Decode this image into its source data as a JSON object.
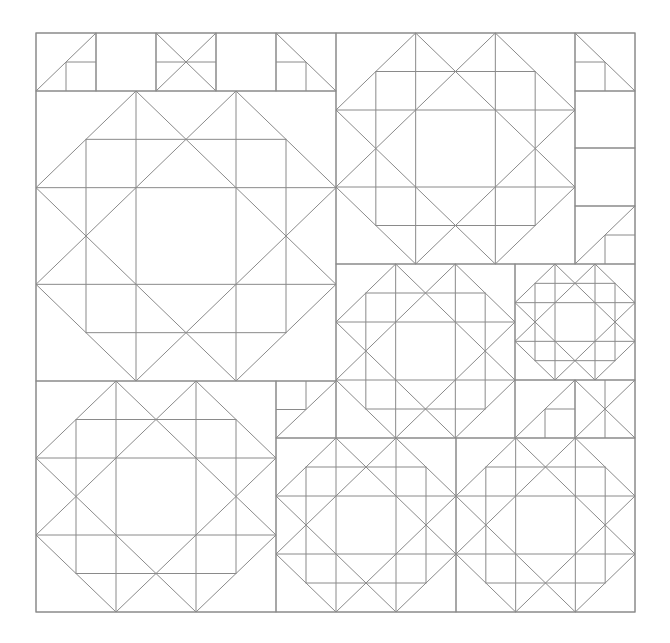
{
  "diagram": {
    "stroke_color": "#8a8a8a",
    "background": "#ffffff",
    "outer_frame": {
      "x": 36,
      "y": 33,
      "w": 599,
      "h": 579
    },
    "star_blocks": [
      {
        "name": "block-large-left",
        "x": 36,
        "y": 91,
        "w": 300,
        "h": 290
      },
      {
        "name": "block-top-middle",
        "x": 336,
        "y": 33,
        "w": 239,
        "h": 231
      },
      {
        "name": "block-center",
        "x": 336,
        "y": 264,
        "w": 179,
        "h": 174
      },
      {
        "name": "block-small-right",
        "x": 515,
        "y": 264,
        "w": 120,
        "h": 116
      },
      {
        "name": "block-bottom-left",
        "x": 36,
        "y": 381,
        "w": 240,
        "h": 231
      },
      {
        "name": "block-bottom-middle",
        "x": 276,
        "y": 438,
        "w": 180,
        "h": 174
      },
      {
        "name": "block-bottom-right",
        "x": 456,
        "y": 438,
        "w": 179,
        "h": 174
      }
    ],
    "filler_cells": [
      {
        "name": "cell-top-1",
        "type": "diag-bl-tr-square-br",
        "x": 36,
        "y": 33,
        "w": 60,
        "h": 58
      },
      {
        "name": "cell-top-2",
        "type": "empty",
        "x": 96,
        "y": 33,
        "w": 60,
        "h": 58
      },
      {
        "name": "cell-top-3",
        "type": "x-cross-midline",
        "x": 156,
        "y": 33,
        "w": 60,
        "h": 58
      },
      {
        "name": "cell-top-4",
        "type": "empty",
        "x": 216,
        "y": 33,
        "w": 60,
        "h": 58
      },
      {
        "name": "cell-top-5",
        "type": "diag-tl-br-square-bl",
        "x": 276,
        "y": 33,
        "w": 60,
        "h": 58
      },
      {
        "name": "cell-right-1",
        "type": "diag-tl-br-square-bl",
        "x": 575,
        "y": 33,
        "w": 60,
        "h": 58
      },
      {
        "name": "cell-right-2",
        "type": "empty",
        "x": 575,
        "y": 91,
        "w": 60,
        "h": 57
      },
      {
        "name": "cell-right-3",
        "type": "empty",
        "x": 575,
        "y": 148,
        "w": 60,
        "h": 58
      },
      {
        "name": "cell-right-4",
        "type": "diag-bl-tr-square-br",
        "x": 575,
        "y": 206,
        "w": 60,
        "h": 58
      },
      {
        "name": "cell-mid-left",
        "type": "diag-bl-tr-square-tl",
        "x": 276,
        "y": 381,
        "w": 60,
        "h": 57
      },
      {
        "name": "cell-mid-right-1",
        "type": "diag-bl-tr-square-br",
        "x": 515,
        "y": 380,
        "w": 60,
        "h": 58
      },
      {
        "name": "cell-mid-right-2",
        "type": "x-cross-vline",
        "x": 575,
        "y": 380,
        "w": 60,
        "h": 58
      }
    ]
  }
}
